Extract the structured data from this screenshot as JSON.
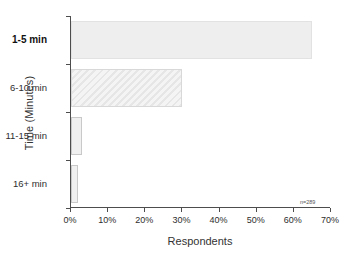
{
  "chart_data": {
    "type": "bar",
    "orientation": "horizontal",
    "title": "",
    "xlabel": "Respondents",
    "ylabel": "Time (Minutes)",
    "categories": [
      "1-5 min",
      "6-10 min",
      "11-15 min",
      "16+ min"
    ],
    "values": [
      65,
      30,
      3,
      2
    ],
    "value_unit": "%",
    "xlim": [
      0,
      70
    ],
    "xticks": [
      0,
      10,
      20,
      30,
      40,
      50,
      60,
      70
    ],
    "xtick_labels": [
      "0%",
      "10%",
      "20%",
      "30%",
      "40%",
      "50%",
      "60%",
      "70%"
    ],
    "grid": false,
    "legend": "none",
    "annotations": [
      {
        "text": "n=289",
        "x": 64,
        "y": 0,
        "position": "bottom-right"
      }
    ],
    "series": [
      {
        "name": "Respondents",
        "values": [
          65,
          30,
          3,
          2
        ],
        "bar_styles": [
          "solid",
          "hatch",
          "outline",
          "outline"
        ]
      }
    ],
    "emphasized_category": "1-5 min",
    "colors": {
      "bar_fill": "#eeeeee",
      "bar_hatch_light": "#f4f4f4",
      "bar_hatch_dark": "#e6e6e6",
      "bar_outline": "#c9c9c9",
      "axis": "#4d4d4d",
      "text": "#2e2e2e",
      "background": "#ffffff"
    }
  }
}
